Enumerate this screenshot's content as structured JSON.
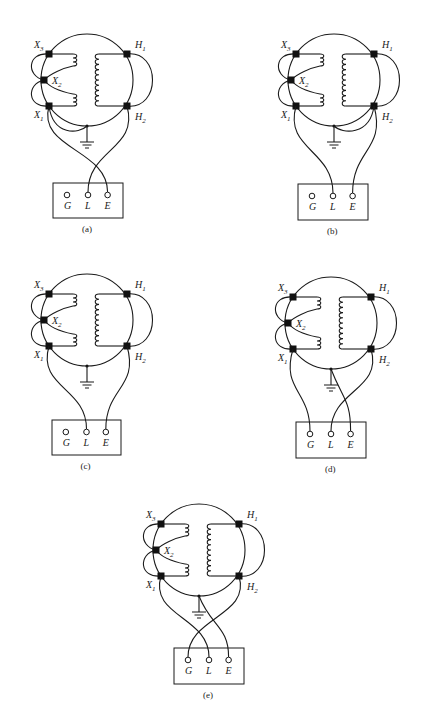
{
  "figure": {
    "type": "transformer test wiring diagrams",
    "panels": [
      {
        "id": "a",
        "caption": "(a)",
        "cx": 87,
        "cy": 80,
        "r": 46,
        "box": {
          "x": 53,
          "y": 183,
          "w": 70,
          "h": 35
        },
        "connections": {
          "L": "H2",
          "E": "X1",
          "X1_to_ground": true,
          "H2_to_ground": false,
          "G": null
        }
      },
      {
        "id": "b",
        "caption": "(b)",
        "cx": 334,
        "cy": 80,
        "r": 46,
        "box": {
          "x": 298,
          "y": 184,
          "w": 70,
          "h": 36
        },
        "connections": {
          "L": "X1",
          "E": "H2",
          "X1_to_ground": false,
          "H2_to_ground": true,
          "G": null
        }
      },
      {
        "id": "c",
        "caption": "(c)",
        "cx": 87,
        "cy": 320,
        "r": 46,
        "box": {
          "x": 52,
          "y": 420,
          "w": 69,
          "h": 35
        },
        "connections": {
          "L": "X1",
          "E": "H2",
          "X1_to_ground": false,
          "H2_to_ground": false,
          "G": null
        }
      },
      {
        "id": "d",
        "caption": "(d)",
        "cx": 331,
        "cy": 323,
        "r": 46,
        "box": {
          "x": 296,
          "y": 422,
          "w": 70,
          "h": 36
        },
        "connections": {
          "G": "X1",
          "L": "H2",
          "E": "ground",
          "X1_to_ground": false,
          "H2_to_ground": false
        }
      },
      {
        "id": "e",
        "caption": "(e)",
        "cx": 199,
        "cy": 550,
        "r": 46,
        "box": {
          "x": 174,
          "y": 648,
          "w": 70,
          "h": 36
        },
        "connections": {
          "G": "H2",
          "L": "X1",
          "E": "ground",
          "X1_to_ground": false,
          "H2_to_ground": false
        }
      }
    ],
    "terminal_labels": {
      "X3": {
        "base": "X",
        "sub": "3"
      },
      "X2": {
        "base": "X",
        "sub": "2"
      },
      "X1": {
        "base": "X",
        "sub": "1"
      },
      "H1": {
        "base": "H",
        "sub": "1"
      },
      "H2": {
        "base": "H",
        "sub": "2"
      }
    },
    "instrument_jacks": [
      "G",
      "L",
      "E"
    ]
  }
}
